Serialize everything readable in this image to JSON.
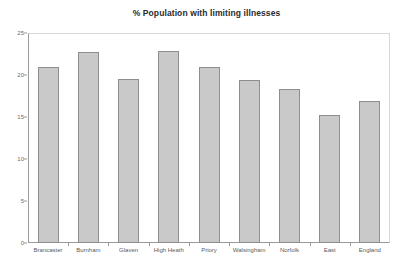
{
  "chart_data": {
    "type": "bar",
    "title": "% Population with limiting illnesses",
    "xlabel": "",
    "ylabel": "",
    "ylim": [
      0,
      25
    ],
    "yticks": [
      0,
      5,
      10,
      15,
      20,
      25
    ],
    "ytick_labels": [
      "0",
      "5",
      "10",
      "15",
      "20",
      "25"
    ],
    "grid": false,
    "legend": false,
    "bar_color": "#c9c9c9",
    "bar_edge_color": "#8e8e8e",
    "categories": [
      "Brancaster",
      "Burnham",
      "Glaven",
      "High Heath",
      "Priory",
      "Walsingham",
      "Norfolk",
      "East",
      "England"
    ],
    "values": [
      20.9,
      22.7,
      19.5,
      22.8,
      20.9,
      19.4,
      18.3,
      15.2,
      16.9
    ]
  }
}
